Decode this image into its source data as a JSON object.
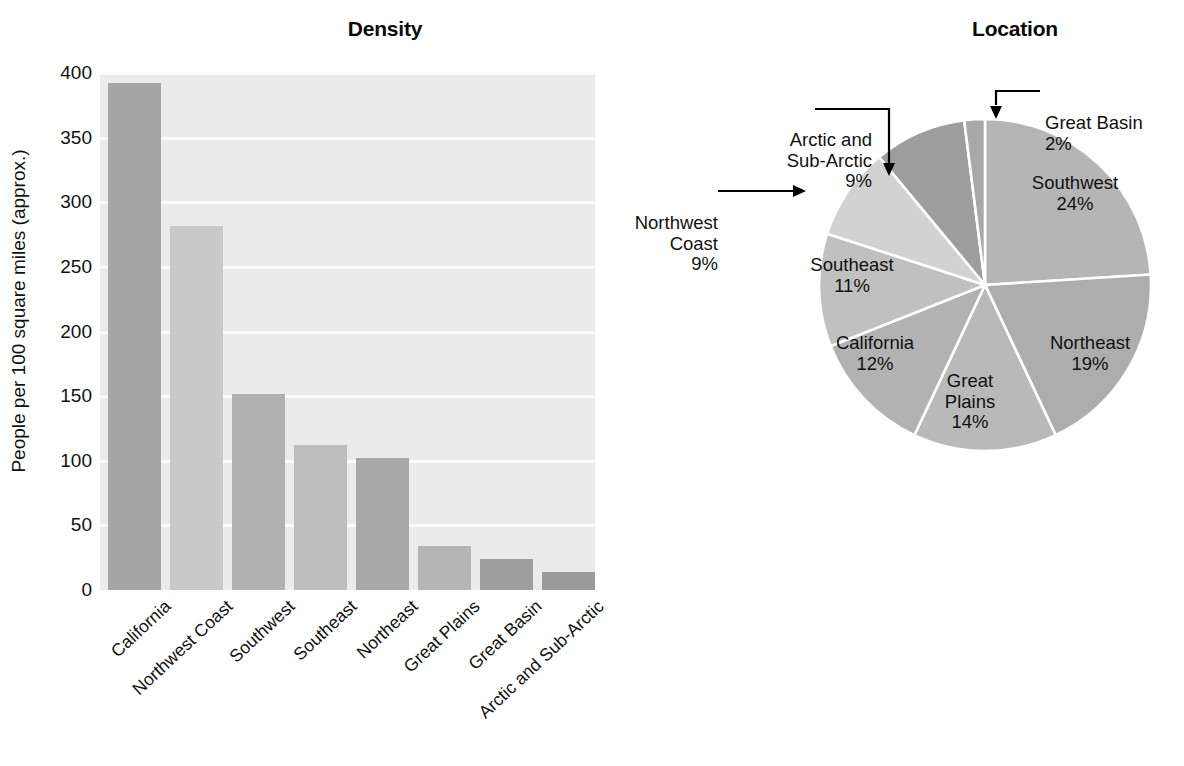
{
  "chart_data": [
    {
      "type": "bar",
      "title": "Density",
      "xlabel": "",
      "ylabel": "People per 100 square miles (approx.)",
      "ylim": [
        0,
        400
      ],
      "yticks": [
        0,
        50,
        100,
        150,
        200,
        250,
        300,
        350,
        400
      ],
      "grid": true,
      "legend": "none",
      "categories": [
        "California",
        "Northwest Coast",
        "Southwest",
        "Southeast",
        "Northeast",
        "Great Plains",
        "Great Basin",
        "Arctic and Sub-Arctic"
      ],
      "values": [
        392,
        282,
        152,
        112,
        102,
        34,
        24,
        14
      ],
      "bar_colors": [
        "#a6a6a6",
        "#c9c9c9",
        "#b0b0b0",
        "#bdbdbd",
        "#a8a8a8",
        "#b5b5b5",
        "#9e9e9e",
        "#9a9a9a"
      ],
      "plot_background": "#ebebeb",
      "gridline_color": "#fbfbfb"
    },
    {
      "type": "pie",
      "title": "Location",
      "legend": "labels-on-slices-and-callouts",
      "start_angle_deg": 0,
      "direction": "clockwise",
      "categories": [
        "Southwest",
        "Northeast",
        "Great Plains",
        "California",
        "Southeast",
        "Northwest Coast",
        "Arctic and Sub-Arctic",
        "Great Basin"
      ],
      "values": [
        24,
        19,
        14,
        12,
        11,
        9,
        9,
        2
      ],
      "value_suffix": "%",
      "slice_colors": [
        "#b5b5b5",
        "#adadad",
        "#b9b9b9",
        "#b2b2b2",
        "#c0c0c0",
        "#d2d2d2",
        "#9d9d9d",
        "#a8a8a8"
      ],
      "separator_color": "#ffffff",
      "slices": [
        {
          "name": "Southwest",
          "pct": 24,
          "label": "Southwest\n24%",
          "placement": "inside"
        },
        {
          "name": "Northeast",
          "pct": 19,
          "label": "Northeast\n19%",
          "placement": "inside"
        },
        {
          "name": "Great Plains",
          "pct": 14,
          "label": "Great\nPlains\n14%",
          "placement": "inside"
        },
        {
          "name": "California",
          "pct": 12,
          "label": "California\n12%",
          "placement": "inside"
        },
        {
          "name": "Southeast",
          "pct": 11,
          "label": "Southeast\n11%",
          "placement": "inside"
        },
        {
          "name": "Northwest Coast",
          "pct": 9,
          "label": "Northwest\nCoast\n9%",
          "placement": "callout-left"
        },
        {
          "name": "Arctic and Sub-Arctic",
          "pct": 9,
          "label": "Arctic and\nSub-Arctic\n9%",
          "placement": "callout-upper-left"
        },
        {
          "name": "Great Basin",
          "pct": 2,
          "label": "Great Basin\n2%",
          "placement": "callout-upper-right"
        }
      ]
    }
  ],
  "bar": {
    "title": "Density",
    "ylabel": "People per 100 square miles (approx.)",
    "yticks": [
      "400",
      "350",
      "300",
      "250",
      "200",
      "150",
      "100",
      "50",
      "0"
    ],
    "xlabels": [
      "California",
      "Northwest Coast",
      "Southwest",
      "Southeast",
      "Northeast",
      "Great Plains",
      "Great Basin",
      "Arctic and Sub-Arctic"
    ]
  },
  "pie": {
    "title": "Location",
    "inside_labels": [
      "Southwest\n24%",
      "Northeast\n19%",
      "Great\nPlains\n14%",
      "California\n12%",
      "Southeast\n11%"
    ],
    "callouts": [
      "Arctic and\nSub-Arctic\n9%",
      "Great Basin\n2%",
      "Northwest\nCoast\n9%"
    ]
  }
}
